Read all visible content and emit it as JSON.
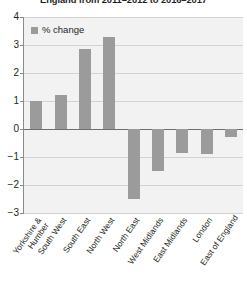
{
  "chart_data": {
    "type": "bar",
    "title": "England from 2011–2012 to 2016–2017",
    "xlabel": "",
    "ylabel": "",
    "ylim": [
      -3,
      4
    ],
    "ytick_values": [
      4,
      3,
      2,
      1,
      0,
      -1,
      -2,
      -3
    ],
    "ytick_labels": [
      "4",
      "3",
      "2",
      "1",
      "0",
      "−1",
      "−2",
      "−3"
    ],
    "grid": true,
    "legend_position": "top-left",
    "categories": [
      "Yorkshire & Humber",
      "South West",
      "South East",
      "North West",
      "North East",
      "West Midlands",
      "East Midlands",
      "London",
      "East of England"
    ],
    "series": [
      {
        "name": "% change",
        "color": "#9b9b9b",
        "values": [
          1.0,
          1.2,
          2.85,
          3.3,
          -2.5,
          -1.5,
          -0.85,
          -0.9,
          -0.3
        ]
      }
    ]
  },
  "legend": {
    "label": "% change",
    "swatch_color": "#9b9b9b"
  },
  "axis": {
    "y_ticks": [
      "4",
      "3",
      "2",
      "1",
      "0",
      "−1",
      "−2",
      "−3"
    ]
  },
  "colors": {
    "bar": "#9b9b9b",
    "plot_background": "#f2f2f2",
    "gridline": "#d2d2d2",
    "zero_line": "#6e6e6e",
    "axis_line": "#8a8a8a",
    "text": "#231f20"
  }
}
